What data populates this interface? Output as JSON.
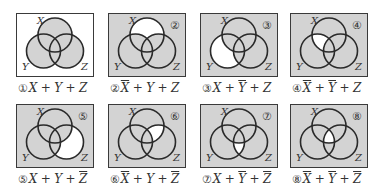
{
  "figure": {
    "colors": {
      "shaded": "#d3d3d3",
      "unshaded": "#ffffff",
      "stroke": "#2a2a2a"
    },
    "set_labels": {
      "x": "X",
      "y": "Y",
      "z": "Z"
    },
    "panels": [
      {
        "id": 1,
        "tag": "",
        "caption_num": "①",
        "terms": [
          {
            "v": "X",
            "bar": false
          },
          {
            "v": "Y",
            "bar": false
          },
          {
            "v": "Z",
            "bar": false
          }
        ],
        "unshaded_region": "outside (universe background white)"
      },
      {
        "id": 2,
        "tag": "②",
        "caption_num": "②",
        "terms": [
          {
            "v": "X",
            "bar": true
          },
          {
            "v": "Y",
            "bar": false
          },
          {
            "v": "Z",
            "bar": false
          }
        ],
        "unshaded_region": "X only"
      },
      {
        "id": 3,
        "tag": "③",
        "caption_num": "③",
        "terms": [
          {
            "v": "X",
            "bar": false
          },
          {
            "v": "Y",
            "bar": true
          },
          {
            "v": "Z",
            "bar": false
          }
        ],
        "unshaded_region": "Y only"
      },
      {
        "id": 4,
        "tag": "④",
        "caption_num": "④",
        "terms": [
          {
            "v": "X",
            "bar": true
          },
          {
            "v": "Y",
            "bar": true
          },
          {
            "v": "Z",
            "bar": false
          }
        ],
        "unshaded_region": "X and Y, not Z"
      },
      {
        "id": 5,
        "tag": "⑤",
        "caption_num": "⑤",
        "terms": [
          {
            "v": "X",
            "bar": false
          },
          {
            "v": "Y",
            "bar": false
          },
          {
            "v": "Z",
            "bar": true
          }
        ],
        "unshaded_region": "Z only"
      },
      {
        "id": 6,
        "tag": "⑥",
        "caption_num": "⑥",
        "terms": [
          {
            "v": "X",
            "bar": true
          },
          {
            "v": "Y",
            "bar": false
          },
          {
            "v": "Z",
            "bar": true
          }
        ],
        "unshaded_region": "X and Z, not Y"
      },
      {
        "id": 7,
        "tag": "⑦",
        "caption_num": "⑦",
        "terms": [
          {
            "v": "X",
            "bar": false
          },
          {
            "v": "Y",
            "bar": true
          },
          {
            "v": "Z",
            "bar": true
          }
        ],
        "unshaded_region": "Y and Z, not X"
      },
      {
        "id": 8,
        "tag": "⑧",
        "caption_num": "⑧",
        "terms": [
          {
            "v": "X",
            "bar": true
          },
          {
            "v": "Y",
            "bar": true
          },
          {
            "v": "Z",
            "bar": true
          }
        ],
        "unshaded_region": "X and Y and Z"
      }
    ]
  }
}
